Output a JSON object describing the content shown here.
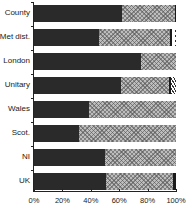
{
  "chart_data": {
    "type": "bar",
    "orientation": "horizontal",
    "stacked": true,
    "normalized": true,
    "title": "",
    "xlabel": "",
    "ylabel": "",
    "xlim": [
      0,
      100
    ],
    "grid": false,
    "legend": null,
    "categories": [
      "County",
      "Met dist.",
      "London",
      "Unitary",
      "Wales",
      "Scot.",
      "NI",
      "UK"
    ],
    "series": [
      {
        "name": "Segment 1 (dark stipple)",
        "values": [
          62,
          46,
          75,
          61,
          39,
          32,
          50,
          51
        ]
      },
      {
        "name": "Segment 2 (cross-hatch)",
        "values": [
          37,
          50,
          25,
          34,
          61,
          68,
          50,
          47
        ]
      },
      {
        "name": "Segment 3 (solid dark)",
        "values": [
          1,
          1.5,
          0,
          1.5,
          0,
          0,
          0,
          2
        ]
      },
      {
        "name": "Segment 4 (gap/white)",
        "values": [
          0,
          1.5,
          0,
          0,
          0,
          0,
          0,
          0
        ]
      },
      {
        "name": "Segment 5 (diagonal stripe / line)",
        "values": [
          0,
          1,
          0,
          3.5,
          0,
          0,
          0,
          0
        ]
      }
    ],
    "xticks": [
      "0%",
      "20%",
      "40%",
      "60%",
      "80%",
      "100%"
    ]
  }
}
